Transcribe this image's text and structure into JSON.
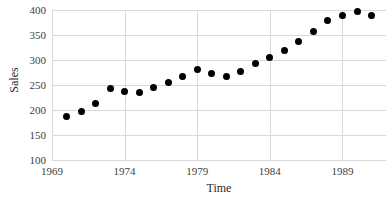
{
  "chart_data": {
    "type": "scatter",
    "title": "",
    "xlabel": "Time",
    "ylabel": "Sales",
    "xlim": [
      1969,
      1992
    ],
    "ylim": [
      100,
      400
    ],
    "grid": true,
    "legend": false,
    "marker": "filled-circle-black",
    "xticks": [
      1969,
      1974,
      1979,
      1984,
      1989
    ],
    "xtick_labels": [
      "1969",
      "1974",
      "1979",
      "1984",
      "1989"
    ],
    "yticks": [
      100,
      150,
      200,
      250,
      300,
      350,
      400
    ],
    "ytick_labels": [
      "100",
      "150",
      "200",
      "250",
      "300",
      "350",
      "400"
    ],
    "x": [
      1970,
      1971,
      1972,
      1973,
      1974,
      1975,
      1976,
      1977,
      1978,
      1979,
      1980,
      1981,
      1982,
      1983,
      1984,
      1985,
      1986,
      1987,
      1988,
      1989,
      1990,
      1991
    ],
    "y": [
      188,
      197,
      213,
      243,
      238,
      236,
      246,
      256,
      268,
      281,
      273,
      268,
      277,
      293,
      305,
      320,
      337,
      357,
      379,
      389,
      397,
      390
    ],
    "points": [
      {
        "x": 1970,
        "y": 188
      },
      {
        "x": 1971,
        "y": 197
      },
      {
        "x": 1972,
        "y": 213
      },
      {
        "x": 1973,
        "y": 243
      },
      {
        "x": 1974,
        "y": 238
      },
      {
        "x": 1975,
        "y": 236
      },
      {
        "x": 1976,
        "y": 246
      },
      {
        "x": 1977,
        "y": 256
      },
      {
        "x": 1978,
        "y": 268
      },
      {
        "x": 1979,
        "y": 281
      },
      {
        "x": 1980,
        "y": 273
      },
      {
        "x": 1981,
        "y": 268
      },
      {
        "x": 1982,
        "y": 277
      },
      {
        "x": 1983,
        "y": 293
      },
      {
        "x": 1984,
        "y": 305
      },
      {
        "x": 1985,
        "y": 320
      },
      {
        "x": 1986,
        "y": 337
      },
      {
        "x": 1987,
        "y": 357
      },
      {
        "x": 1988,
        "y": 379
      },
      {
        "x": 1989,
        "y": 389
      },
      {
        "x": 1990,
        "y": 397
      },
      {
        "x": 1991,
        "y": 390
      }
    ]
  },
  "axes": {
    "x_title": "Time",
    "y_title": "Sales"
  },
  "colors": {
    "marker": "#000000",
    "grid": "#d9d9d9",
    "axis": "#8a8a8a",
    "text": "#404040",
    "background": "#ffffff"
  }
}
